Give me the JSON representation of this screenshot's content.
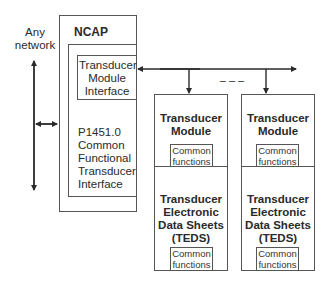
{
  "network_label": "Any network",
  "ncap": {
    "title": "NCAP",
    "tmi_label": "Transducer Module Interface",
    "functional_interface_label": "P1451.0 Common Functional Transducer Interface"
  },
  "bus_ellipsis": "– – –",
  "modules": [
    {
      "title": "Transducer Module",
      "module_common": "Common functions",
      "teds_title": "Transducer Electronic Data Sheets (TEDS)",
      "teds_common": "Common functions"
    },
    {
      "title": "Transducer Module",
      "module_common": "Common functions",
      "teds_title": "Transducer Electronic Data Sheets (TEDS)",
      "teds_common": "Common functions"
    }
  ],
  "colors": {
    "line": "#2a2a2a",
    "border": "#555555"
  }
}
